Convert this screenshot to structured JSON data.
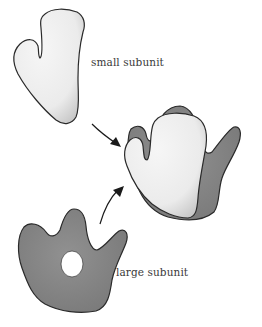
{
  "diagram": {
    "labels": {
      "small_subunit": "small subunit",
      "large_subunit": "large subunit"
    },
    "colors": {
      "background": "#ffffff",
      "small_subunit_fill": "#ececec",
      "large_subunit_fill": "#8a8a8a",
      "outline": "#2a2a2a",
      "arrow": "#1a1a1a"
    },
    "components": [
      "small subunit",
      "large subunit",
      "assembled ribosome"
    ]
  }
}
